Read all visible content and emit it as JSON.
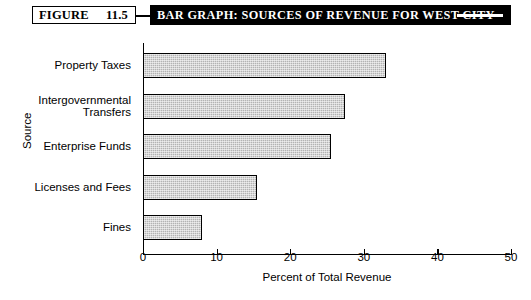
{
  "figure": {
    "word": "FIGURE",
    "number": "11.5",
    "banner_title": "BAR GRAPH: SOURCES OF REVENUE FOR WEST CITY"
  },
  "chart_data": {
    "type": "bar",
    "orientation": "horizontal",
    "title": "BAR GRAPH: SOURCES OF REVENUE FOR WEST CITY",
    "categories": [
      "Property Taxes",
      "Intergovernmental\nTransfers",
      "Enterprise Funds",
      "Licenses and Fees",
      "Fines"
    ],
    "values": [
      33,
      27.5,
      25.5,
      15.5,
      8
    ],
    "xlabel": "Percent of Total Revenue",
    "ylabel": "Source",
    "xlim": [
      0,
      50
    ],
    "xticks": [
      "0",
      "10",
      "20",
      "30",
      "40",
      "50"
    ],
    "xtick_values": [
      0,
      10,
      20,
      30,
      40,
      50
    ],
    "grid": false,
    "legend": false,
    "bar_fill_color": "#b3b3b3",
    "bar_edge_color": "#000000"
  }
}
